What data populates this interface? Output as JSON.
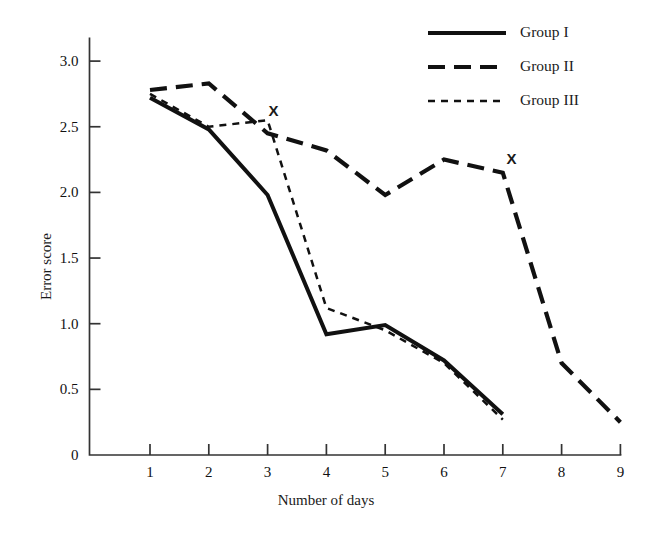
{
  "chart_data": {
    "type": "line",
    "title": "",
    "xlabel": "Number of days",
    "ylabel": "Error score",
    "xlim": [
      0,
      9.4
    ],
    "ylim": [
      0,
      3.2
    ],
    "grid": false,
    "legend_position": "top-right",
    "xticks": [
      "1",
      "2",
      "3",
      "4",
      "5",
      "6",
      "7",
      "8",
      "9"
    ],
    "xtick_values": [
      1,
      2,
      3,
      4,
      5,
      6,
      7,
      8,
      9
    ],
    "yticks": [
      "0",
      "0.5",
      "1.0",
      "1.5",
      "2.0",
      "2.5",
      "3.0"
    ],
    "ytick_values": [
      0,
      0.5,
      1.0,
      1.5,
      2.0,
      2.5,
      3.0
    ],
    "series": [
      {
        "name": "Group I",
        "style": "solid",
        "x": [
          1,
          2,
          3,
          4,
          5,
          6,
          7
        ],
        "values": [
          2.72,
          2.48,
          1.98,
          0.92,
          0.99,
          0.72,
          0.31
        ]
      },
      {
        "name": "Group II",
        "style": "long-dash",
        "x": [
          1,
          2,
          3,
          4,
          5,
          6,
          7,
          8,
          9
        ],
        "values": [
          2.78,
          2.83,
          2.45,
          2.32,
          1.98,
          2.25,
          2.15,
          0.7,
          0.25
        ]
      },
      {
        "name": "Group III",
        "style": "short-dash",
        "x": [
          1,
          2,
          3,
          4,
          5,
          6,
          7
        ],
        "values": [
          2.75,
          2.5,
          2.55,
          1.12,
          0.95,
          0.7,
          0.27
        ]
      }
    ],
    "annotations": [
      {
        "text": "X",
        "x": 3.1,
        "y": 2.63
      },
      {
        "text": "X",
        "x": 7.15,
        "y": 2.26
      }
    ]
  },
  "legend": {
    "items": [
      {
        "label": "Group I"
      },
      {
        "label": "Group II"
      },
      {
        "label": "Group III"
      }
    ]
  },
  "axes": {
    "x_title": "Number of days",
    "y_title": "Error score"
  },
  "colors": {
    "line": "#111111",
    "axis": "#333333",
    "background": "#ffffff"
  }
}
